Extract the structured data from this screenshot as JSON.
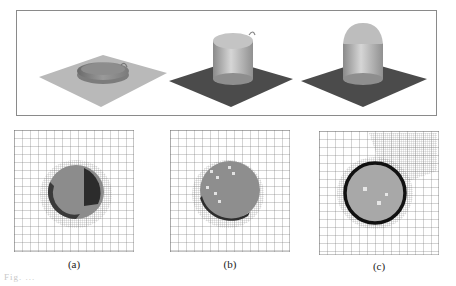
{
  "figure": {
    "top_row": {
      "renders": [
        {
          "id": "a",
          "description": "flat plate with shallow circular disc / droplet",
          "plate_color": "#b8b8b8"
        },
        {
          "id": "b",
          "description": "dark plate with cylindrical column, small bump on top",
          "plate_color": "#4a4a4a"
        },
        {
          "id": "c",
          "description": "dark plate with dome-capped cylinder",
          "plate_color": "#4a4a4a"
        }
      ]
    },
    "bottom_row": {
      "panels": [
        {
          "id": "a",
          "label": "(a)"
        },
        {
          "id": "b",
          "label": "(b)"
        },
        {
          "id": "c",
          "label": "(c)"
        }
      ]
    },
    "caption": "Fig. ..."
  }
}
